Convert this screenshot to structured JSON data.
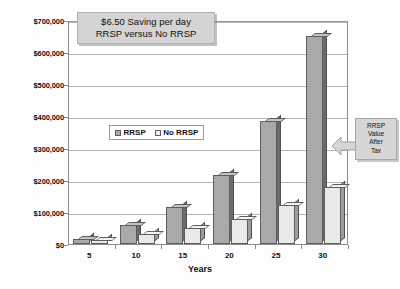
{
  "chart_data": {
    "type": "bar",
    "title": "$6.50 Saving per day RRSP versus No RRSP",
    "title_line1": "$6.50 Saving per day",
    "title_line2": "RRSP versus No RRSP",
    "xlabel": "Years",
    "ylabel": "",
    "categories": [
      "5",
      "10",
      "15",
      "20",
      "25",
      "30"
    ],
    "series": [
      {
        "name": "RRSP",
        "values": [
          15000,
          58000,
          115000,
          215000,
          385000,
          650000
        ]
      },
      {
        "name": "No RRSP",
        "values": [
          11000,
          32000,
          50000,
          78000,
          122000,
          178000
        ]
      }
    ],
    "ylim": [
      0,
      700000
    ],
    "ytick_values": [
      0,
      100000,
      200000,
      300000,
      400000,
      500000,
      600000,
      700000
    ],
    "ytick_labels": [
      "$0",
      "$100,000",
      "$200,000",
      "$300,000",
      "$400,000",
      "$500,000",
      "$600,000",
      "$700,000"
    ],
    "grid": true,
    "legend_position": "inside-upper-left",
    "annotations": [
      {
        "name": "rrsp-value-after-tax-callout",
        "lines": [
          "RRSP",
          "Value",
          "After",
          "Tax"
        ],
        "text": "RRSP Value After Tax",
        "points_to": "RRSP bar at year 30"
      }
    ],
    "colors": {
      "series_rrsp_fill": "#a9a9a9",
      "series_norrsp_fill": "#e9e9e9",
      "bar_outline": "#5e5e5e",
      "gridline": "#b4b4b4",
      "plot_border": "#8c8c8c",
      "title_box_bg": "#d4d4d4",
      "callout_bg": "#d6d6d6",
      "background": "#fdfdfd",
      "text": "#111111"
    }
  },
  "legend": {
    "entries": [
      {
        "label": "RRSP"
      },
      {
        "label": "No RRSP"
      }
    ]
  }
}
